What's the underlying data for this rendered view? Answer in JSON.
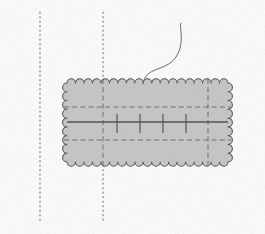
{
  "figure": {
    "kind": "technical-schematic-diagram",
    "title": "",
    "caption": "",
    "background_color": "#fdfdfd",
    "stroke_color": "#4a4a4a",
    "dash_color": "#6b6b6b",
    "dotted_guide_color": "#7a7a7a",
    "panel_fill_color": "#c9c9c9",
    "width": 265,
    "height": 234
  },
  "panel": {
    "name": "scalloped-rectangle",
    "description": "shaded rectangular patch with wavy scalloped border",
    "left": 67,
    "top": 83,
    "right": 228,
    "bottom": 162,
    "width": 161,
    "height": 79,
    "fill": "#c9c9c9",
    "border_color": "#555555",
    "scallop_count_horizontal": 11,
    "scallop_count_vertical": 6,
    "scallop_radius": 4.2
  },
  "guides": {
    "vertical_dotted": [
      {
        "name": "left-dotted-guide",
        "x": 40,
        "y_top": 12,
        "y_bottom": 222
      },
      {
        "name": "center-dotted-guide",
        "x": 103,
        "y_top": 12,
        "y_bottom": 222
      }
    ],
    "horizontal_dashed": [
      {
        "name": "upper-dashed-line",
        "y": 107,
        "x_start": 67,
        "x_end": 228
      },
      {
        "name": "lower-dashed-line",
        "y": 140,
        "x_start": 67,
        "x_end": 228
      }
    ],
    "vertical_dashed": [
      {
        "name": "left-inner-dashed-line",
        "x": 103,
        "y_start": 83,
        "y_end": 162
      },
      {
        "name": "right-inner-dashed-line",
        "x": 208,
        "y_start": 83,
        "y_end": 162
      }
    ],
    "center_axis": {
      "name": "center-solid-axis",
      "y": 122,
      "x_start": 67,
      "x_end": 228,
      "color": "#555555"
    }
  },
  "ticks": {
    "name": "axis-tick-marks",
    "orientation": "downward",
    "y_top": 114,
    "y_bottom": 133,
    "positions": [
      117,
      140,
      163,
      186
    ],
    "color": "#4a4a4a"
  },
  "thread": {
    "name": "curved-thread",
    "description": "S-shaped curved filament rising from the top edge of the panel",
    "anchor_x": 143,
    "anchor_y": 83,
    "apex_x": 181,
    "apex_y": 23,
    "color": "#6a6a6a",
    "path": "M143,84 C145,66 166,72 176,57 C186,42 178,24 181,23"
  },
  "labels": {
    "items": []
  }
}
